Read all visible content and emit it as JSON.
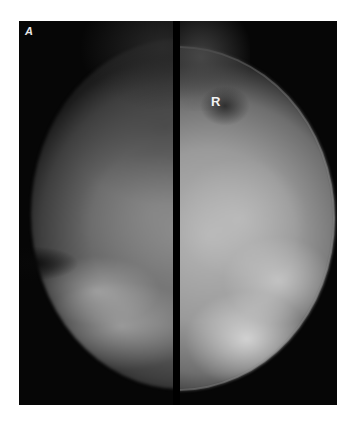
{
  "figure": {
    "panel_label": "A",
    "views": [
      {
        "side": "left",
        "marker": ""
      },
      {
        "side": "right",
        "marker": "R"
      }
    ],
    "colors": {
      "background": "#ffffff",
      "film": "#050505",
      "divider": "#000000"
    }
  }
}
